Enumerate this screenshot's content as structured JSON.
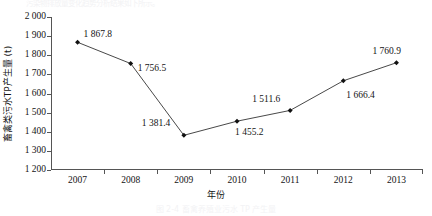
{
  "figure": {
    "top_text_remnant": "污染物排放量变化趋势分析结果如下所示。",
    "caption_remnant": "图 2-4  畜禽养殖业污水 TP 产生量"
  },
  "chart_data": {
    "type": "line",
    "title": "",
    "xlabel": "年份",
    "ylabel": "畜禽类污水TP产生量 (t)",
    "categories": [
      "2007",
      "2008",
      "2009",
      "2010",
      "2011",
      "2012",
      "2013"
    ],
    "values": [
      1867.8,
      1756.5,
      1381.4,
      1455.2,
      1511.6,
      1666.4,
      1760.9
    ],
    "point_labels": [
      "1 867.8",
      "1 756.5",
      "1 381.4",
      "1 455.2",
      "1 511.6",
      "1 666.4",
      "1 760.9"
    ],
    "ylim": [
      1200,
      2000
    ],
    "yticks": [
      1200,
      1300,
      1400,
      1500,
      1600,
      1700,
      1800,
      1900,
      2000
    ],
    "ytick_labels": [
      "1 200",
      "1 300",
      "1 400",
      "1 500",
      "1 600",
      "1 700",
      "1 800",
      "1 900",
      "2 000"
    ],
    "grid": false,
    "legend": "none",
    "marker": "filled-diamond",
    "line_color": "#333333",
    "marker_color": "#111111",
    "axis_color": "#555555",
    "label_offsets": [
      {
        "dx": 6,
        "dy": -13
      },
      {
        "dx": 7,
        "dy": -1
      },
      {
        "dx": -42,
        "dy": -17
      },
      {
        "dx": -2,
        "dy": 6
      },
      {
        "dx": -38,
        "dy": -16
      },
      {
        "dx": 3,
        "dy": 9
      },
      {
        "dx": -24,
        "dy": -17
      }
    ]
  }
}
